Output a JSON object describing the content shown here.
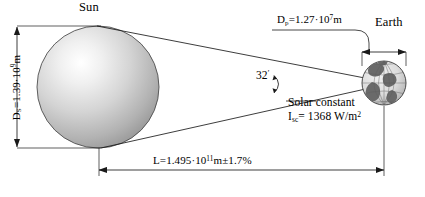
{
  "figure": {
    "sun": {
      "label": "Sun",
      "diameter_symbol": "D",
      "diameter_subscript": "S",
      "diameter_mantissa": "=1.39",
      "diameter_dot": "·",
      "diameter_base": "10",
      "diameter_exponent": "9",
      "diameter_unit": "m"
    },
    "earth": {
      "label": "Earth",
      "diameter_symbol": "D",
      "diameter_subscript": "p",
      "diameter_mantissa": "=1.27",
      "diameter_dot": "·",
      "diameter_base": "10",
      "diameter_exponent": "7",
      "diameter_unit": "m"
    },
    "angle": {
      "value": "32",
      "unit": "′"
    },
    "solar_constant": {
      "caption": "Solar constant",
      "symbol": "I",
      "subscript": "sc",
      "equals": "= 1368 W/m",
      "exponent": "2"
    },
    "distance": {
      "symbol": "L",
      "value": "=1.495",
      "dot": "·",
      "base": "10",
      "exponent": "11",
      "unit": "m",
      "tolerance": "±1.7%"
    },
    "colors": {
      "line": "#1a1a1a",
      "sun_core": "#ffffff",
      "sun_mid": "#cfcfcf",
      "sun_edge": "#8f8f8f",
      "sun_outline": "#4a4a4a",
      "earth_land": "#5d5d5d",
      "earth_ocean": "#e8e8e8",
      "earth_grid": "#6b6b6b",
      "background": "#ffffff"
    }
  }
}
